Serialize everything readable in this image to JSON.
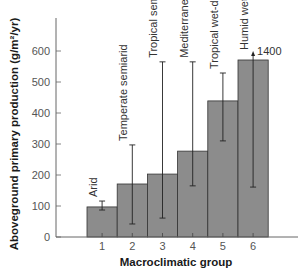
{
  "chart_data": {
    "type": "bar",
    "title": "",
    "xlabel": "Macroclimatic group",
    "ylabel": "Aboveground primary production (g/m²/yr)",
    "ylim": [
      0,
      700
    ],
    "yticks": [
      0,
      100,
      200,
      300,
      400,
      500,
      600
    ],
    "grid": false,
    "legend": null,
    "categories": [
      "1",
      "2",
      "3",
      "4",
      "5",
      "6"
    ],
    "category_names": [
      "Arid",
      "Temperate semiarid",
      "Tropical semiarid",
      "Mediterranean",
      "Tropical wet-dry",
      "Humid wet"
    ],
    "values": [
      97,
      171,
      203,
      277,
      439,
      571
    ],
    "error_low": [
      87,
      42,
      61,
      165,
      310,
      161
    ],
    "error_high": [
      116,
      297,
      565,
      565,
      529,
      1400
    ],
    "annotations": [
      {
        "text": "1400",
        "category": "6",
        "note": "upper error bar extends off-scale to 1400 (arrow)"
      }
    ],
    "colors": {
      "bar_fill": "#8c8c8c",
      "bar_edge": "#333333",
      "axis": "#555555",
      "error_bar": "#222222"
    }
  }
}
